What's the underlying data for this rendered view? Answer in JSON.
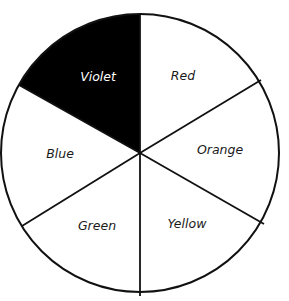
{
  "diagram": {
    "type": "color-wheel",
    "center": [
      140,
      153
    ],
    "radius": 139,
    "segments": [
      {
        "label": "Red",
        "fill": "#ffffff",
        "text_color": "#1a1a1a"
      },
      {
        "label": "Orange",
        "fill": "#ffffff",
        "text_color": "#1a1a1a"
      },
      {
        "label": "Yellow",
        "fill": "#ffffff",
        "text_color": "#1a1a1a"
      },
      {
        "label": "Green",
        "fill": "#ffffff",
        "text_color": "#1a1a1a"
      },
      {
        "label": "Blue",
        "fill": "#ffffff",
        "text_color": "#1a1a1a"
      },
      {
        "label": "Violet",
        "fill": "#000000",
        "text_color": "#ffffff"
      }
    ]
  }
}
